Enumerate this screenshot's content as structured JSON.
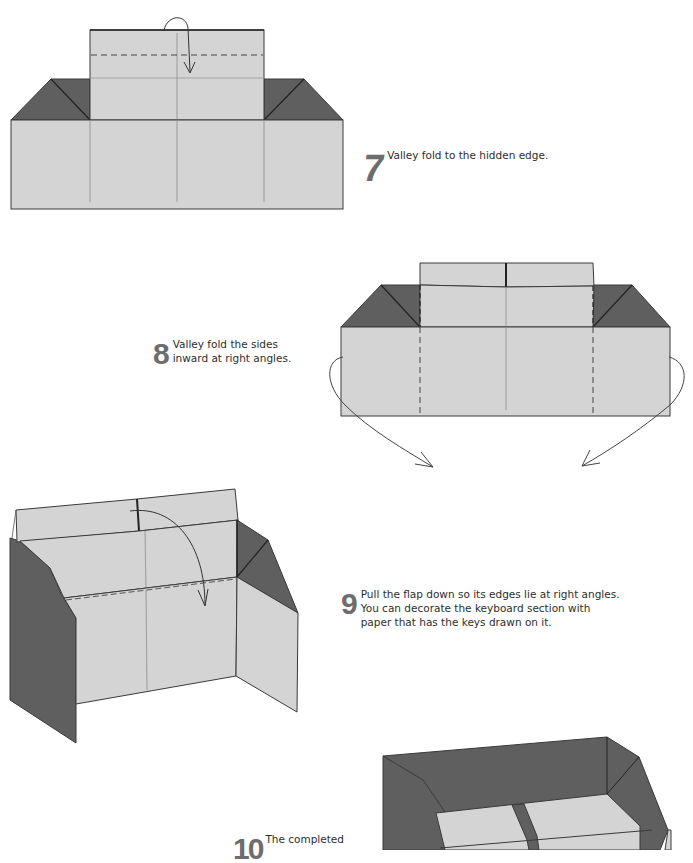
{
  "colors": {
    "paper_light": "#d4d4d4",
    "paper_dark": "#5f5f5f",
    "line": "#3a3a3a",
    "crease": "#8a8a8a",
    "step_number": "#6d6d6d",
    "text": "#2e2e2e"
  },
  "steps": [
    {
      "number": "7",
      "text": "Valley fold to the hidden edge."
    },
    {
      "number": "8",
      "text": "Valley fold the sides inward at right angles."
    },
    {
      "number": "9",
      "text": "Pull the flap down so its edges lie at right angles. You can decorate the keyboard section with paper that has the keys drawn on it."
    },
    {
      "number": "10",
      "text": "The completed"
    }
  ],
  "icons": {
    "step7_arrow": "valley-fold-arrow-icon",
    "step8_arrows": "fold-inward-arrows-icon",
    "step9_arrow": "pull-down-arrow-icon"
  }
}
